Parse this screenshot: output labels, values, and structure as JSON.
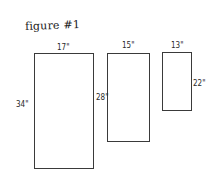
{
  "diagram": {
    "title": "figure #1",
    "rectangles": [
      {
        "id": "rect-1",
        "width_label": "17\"",
        "height_label": "34\"",
        "box": {
          "left": 34,
          "top": 53,
          "width": 60,
          "height": 116
        }
      },
      {
        "id": "rect-2",
        "width_label": "15\"",
        "height_label": "28\"",
        "box": {
          "left": 107,
          "top": 53,
          "width": 43,
          "height": 89
        }
      },
      {
        "id": "rect-3",
        "width_label": "13\"",
        "height_label": "22\"",
        "box": {
          "left": 162,
          "top": 52,
          "width": 30,
          "height": 59
        }
      }
    ],
    "stroke_color": "#3a3a3a",
    "background": "#ffffff"
  }
}
